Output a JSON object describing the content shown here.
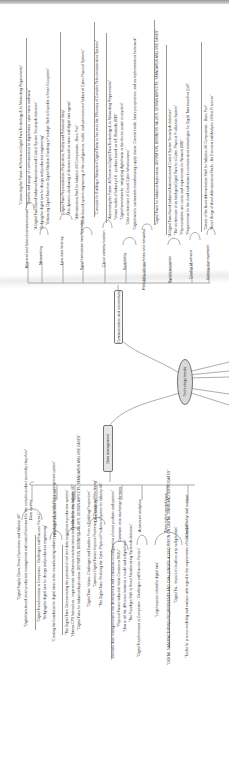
{
  "diagram": {
    "type": "mind-map",
    "orientation": "rotated-90",
    "root": {
      "label": "Technology trends"
    },
    "branches": [
      {
        "label": "Communication and connectivity",
        "categories": [
          {
            "label": "Bilateral and lateral communication",
            "leaves": [
              "\"Connecting the Future: A Review on Digital Twin Technology & its Networking Requirements\"",
              "\"Benefits and usage of communication for digital twins, cyber twins and twins\""
            ]
          },
          {
            "label": "Networking",
            "leaves": [
              "\"A Digital Twin Based Industrial Automation and Control System Security Architecture\"",
              "\"Bi-directional and low-latency information based on twins and digital twin agents\"",
              "\"Enhancing Digital Twin from Digital Shadow: Enabling a Paradigm Shift to Expedite a Smart Ecosystem\""
            ]
          },
          {
            "label": "Low data latency",
            "leaves": [
              "\"Digital Twin Representation, Replication, Reality and Relational Unity\"",
              "\"A bi-dynamic shadowing of distance-based on twins and digital twin agents\""
            ]
          },
          {
            "label": "Synchronization management",
            "leaves": [
              "\"Model-based system engineering of the configuration, model, and optimization of Industrial Cyber-Physical Systems\"",
              "\"Administration Shell for Industrie 4.0 Components - Basic Part\""
            ]
          },
          {
            "label": "Cloud communication",
            "leaves": [
              "\"Concepts for Building a Network of Digital Twins to Increase the Efficiency of Complex Telecommunication Systems\""
            ]
          },
          {
            "label": "Scalability",
            "leaves": [
              "\"Automating the Future: A Review on Digital Twin Technology & its Networking Requirements\"",
              "\"Virtual models of Industry 4.0 - products based on IoT, Bhatteda 2018\"",
              "\"Digital twin networks: integrating digital twins in the electric power ecosystem\"",
              "\"Data architecture of Critical Cyber Infrastructures\""
            ]
          },
          {
            "label": "Reliability of machines and networks",
            "leaves": [
              "\"Digital twin for sustainable manufacturing supply chains: Current trends, future perspectives, and an implementation framework\""
            ]
          },
          {
            "label": "Synchronization",
            "leaves": [
              "\"Digital Twins for Industrial Applications DEFINITION, BUSINESS VALUES, DESIGN ASPECTS, STANDARDS AND USE CASES\"",
              "\"A Digital Twin Based Industrial Automation and Control System Security Architecture\"",
              "\"The architecture of an Intelligent Digital Twin for a Cyber-Physical Production System\""
            ]
          },
          {
            "label": "Quality of service",
            "leaves": [
              "\"Representative use cases and requirements for Network 2030\"",
              "\"Requirements for the cloud and network communication technologies for Digital Twin based on QoS\""
            ]
          },
          {
            "label": "Identity management",
            "leaves": [
              "\"Details of the Asset Administration Shell for Industrie 4.0 Components - Basic Part\"",
              "\"Asset Usage of Asset Administration Shells - An Overview and Analysis of Best Practices\""
            ]
          }
        ]
      },
      {
        "label": "Data management",
        "categories": [
          {
            "label": "Data quality",
            "leaves": [
              "\"Digital Supply Chain, Smart Operations and Industry 4.0\"",
              "\"Digital twin-based smart production management and control framework for the complex product assembly shop-floor\"",
              "\"Digital Transformation in Companies - Challenges and Success Factors\"",
              "\"Bridging the digital turn for design and production engineering\""
            ]
          },
          {
            "label": "Heterogeneous data capture",
            "leaves": [
              "\"Creating the foundation for digital twins in the manufacturing industry: an integrated installed base management system\""
            ]
          },
          {
            "label": "Stable data acquisition",
            "leaves": [
              "\"The Digital Twin: Demonstrating the potential of real time data acquisition in production systems\"",
              "\"Human-CPS Interaction - requirements and human-machine interaction methods for the Industry 4.0\"",
              "\"Digital Twins for Industrial Applications DEFINITION, BUSINESS VALUES, DESIGN ASPECTS, STANDARDS AND USE CASES\""
            ]
          },
          {
            "label": "Data security",
            "leaves": [
              "\"Digital Twin: Values, Challenges and Enablers From a Modeling Perspective\"",
              "\"Dynamic Digital Twin to Improve Resilience of Change and Machining\"",
              "\"The Digital Twin: Realizing the Cyber-Physical Production System for Industry 4.0\""
            ]
          },
          {
            "label": "Common data exchange formats",
            "leaves": [
              "\"Semantic data management for the development and continuous reconfiguration of smart products and systems\"",
              "\"Physical Twin to Industrial Value Creation in SMEs\"",
              "\"How to tell the difference between a model and a digital twin\"",
              "\"The Paradigm Shift in Smart Manufacturing System Architecture\""
            ]
          },
          {
            "label": "Advanced analytics",
            "leaves": [
              "\"Digital Transformation in Companies - Challenges and Success Factors\""
            ]
          },
          {
            "label": "Data rights compliance",
            "leaves": [
              "\"Legal aspects related to digital twin\"",
              "\"DIGITAL MANUFACTURING REQUIREMENTS AND CHALLENGES: A DISCUSSION ON DIGITAL TWINS AND SURROGATES\"",
              "\"Digital Tw... Impact of cloud security in digital twin\""
            ]
          },
          {
            "label": "Compatibility tool support",
            "leaves": [
              "\"Toolkit for process modeling and analysis with regard to the requirements of Industry 4.0\""
            ]
          }
        ]
      }
    ]
  }
}
